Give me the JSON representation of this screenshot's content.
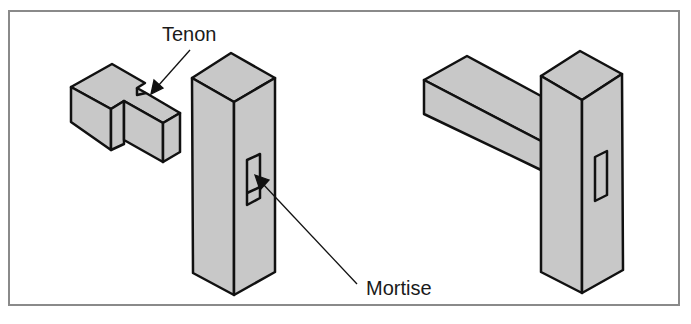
{
  "diagram": {
    "labels": {
      "tenon": "Tenon",
      "mortise": "Mortise"
    },
    "parts": [
      {
        "id": "tenon-piece",
        "description": "Rail end with tenon"
      },
      {
        "id": "mortised-post",
        "description": "Post with mortise slot"
      },
      {
        "id": "assembled-joint",
        "description": "Rail joined into post"
      }
    ],
    "colors": {
      "fill": "#c8c8c8",
      "stroke": "#111111",
      "border": "#8a8a8a",
      "background": "#ffffff"
    }
  }
}
